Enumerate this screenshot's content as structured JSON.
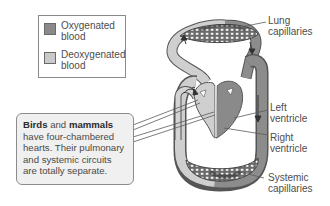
{
  "legend": {
    "items": [
      {
        "label": "Oxygenated blood",
        "line1": "Oxygenated",
        "line2": "blood",
        "color": "#8a8a8a"
      },
      {
        "label": "Deoxygenated blood",
        "line1": "Deoxygenated",
        "line2": "blood",
        "color": "#c9c9c9"
      }
    ]
  },
  "callout": {
    "bold1": "Birds",
    "text1": " and ",
    "bold2": "mammals",
    "text2": " have four-chambered hearts. Their pulmonary and systemic circuits are totally separate."
  },
  "labels": {
    "lung_capillaries": {
      "line1": "Lung",
      "line2": "capillaries"
    },
    "left_ventricle": {
      "line1": "Left",
      "line2": "ventricle"
    },
    "right_ventricle": {
      "line1": "Right",
      "line2": "ventricle"
    },
    "systemic_capillaries": {
      "line1": "Systemic",
      "line2": "capillaries"
    }
  },
  "colors": {
    "oxygenated": "#8a8a8a",
    "deoxygenated": "#c9c9c9",
    "outline": "#555555"
  }
}
